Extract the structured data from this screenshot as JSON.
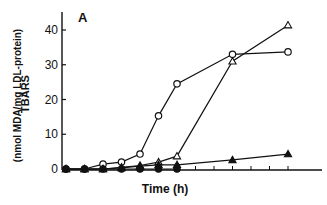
{
  "chart_data": {
    "type": "line",
    "title": "",
    "panel_label": "A",
    "xlabel": "Time (h)",
    "ylabel": "TBARS",
    "ylabel_units": "(nmol MDA/mg LDL-protein)",
    "ylim": [
      0,
      45
    ],
    "yticks": [
      0,
      10,
      20,
      30,
      40
    ],
    "xticks_count": 13,
    "grid": false,
    "legend": null,
    "x": [
      0,
      1,
      2,
      3,
      4,
      5,
      6,
      9,
      12
    ],
    "series": [
      {
        "name": "open circles",
        "marker": "circle-open",
        "values": [
          0,
          0,
          1.4,
          2.0,
          4.3,
          15.3,
          24.5,
          33.0,
          33.7
        ]
      },
      {
        "name": "open triangles",
        "marker": "triangle-open",
        "values": [
          0,
          0,
          0,
          0.5,
          1.0,
          2.0,
          3.7,
          31.0,
          41.4
        ]
      },
      {
        "name": "filled triangles",
        "marker": "triangle-filled",
        "values": [
          0,
          0,
          0,
          0.3,
          0.8,
          1.2,
          1.2,
          2.6,
          4.3
        ]
      },
      {
        "name": "filled circles",
        "marker": "circle-filled",
        "values": [
          0,
          0,
          0,
          0,
          0,
          0,
          0,
          null,
          null
        ]
      }
    ]
  }
}
